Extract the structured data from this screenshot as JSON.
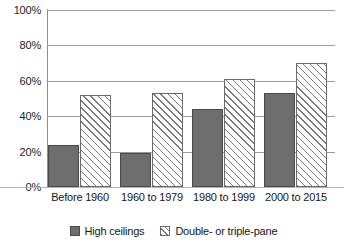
{
  "chart_data": {
    "type": "bar",
    "title": "",
    "subtitle": "",
    "xlabel": "",
    "ylabel": "",
    "categories": [
      "Before 1960",
      "1960 to 1979",
      "1980 to 1999",
      "2000 to 2015"
    ],
    "series": [
      {
        "name": "High ceilings",
        "style": "solid",
        "color": "#6e6e6e",
        "values": [
          24,
          19,
          44,
          53
        ]
      },
      {
        "name": "Double- or triple-pane",
        "style": "hatched",
        "color": "#ffffff",
        "values": [
          52,
          53,
          61,
          70
        ]
      }
    ],
    "ylim": [
      0,
      100
    ],
    "ytick_values": [
      0,
      20,
      40,
      60,
      80,
      100
    ],
    "ytick_labels": [
      "0%",
      "20%",
      "40%",
      "60%",
      "80%",
      "100%"
    ],
    "grid": true,
    "grid_axis": "y",
    "legend_position": "bottom-center"
  },
  "colors": {
    "series_solid": "#6e6e6e",
    "series_solid_border": "#4a4a4a",
    "series_hatch_line": "#777777",
    "series_hatch_border": "#6a6a6a",
    "gridline": "#9a9a9a",
    "axis": "#8e8e8e",
    "background": "#ffffff",
    "text": "#161616"
  }
}
